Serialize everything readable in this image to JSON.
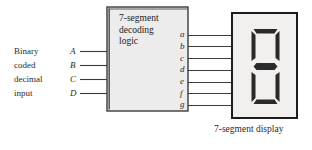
{
  "figure": {
    "background_color": "#ffffff",
    "line_color": "#3a3a3a",
    "box_fill": "#ececec",
    "box_border": "#3a3a3a",
    "display_fill": "#f2f0ee",
    "display_border": "#1c1c1c",
    "segment_color": "#2a2a2a"
  },
  "block": {
    "line1": "7-segment",
    "line2": "decoding",
    "line3": "logic"
  },
  "inputs": {
    "description_lines": [
      "Binary",
      "coded",
      "decimal",
      "input"
    ],
    "signals": [
      {
        "name": "A"
      },
      {
        "name": "B"
      },
      {
        "name": "C"
      },
      {
        "name": "D"
      }
    ]
  },
  "outputs": {
    "signals": [
      {
        "name": "a"
      },
      {
        "name": "b"
      },
      {
        "name": "c"
      },
      {
        "name": "d"
      },
      {
        "name": "e"
      },
      {
        "name": "f"
      },
      {
        "name": "g"
      }
    ]
  },
  "display": {
    "caption": "7-segment display",
    "lit_segments": [
      "a",
      "b",
      "c",
      "d",
      "e",
      "f",
      "g"
    ],
    "digit_shown": "8"
  }
}
